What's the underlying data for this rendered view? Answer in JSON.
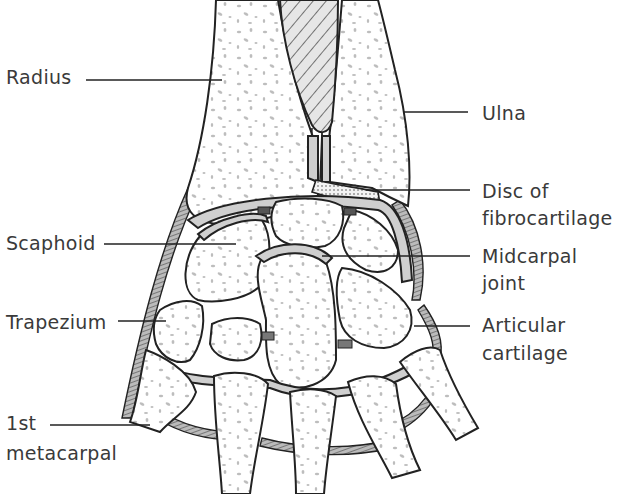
{
  "figure": {
    "labels": {
      "radius": "Radius",
      "ulna": "Ulna",
      "disc_line1": "Disc of",
      "disc_line2": "fibrocartilage",
      "scaphoid": "Scaphoid",
      "midcarpal_line1": "Midcarpal",
      "midcarpal_line2": "joint",
      "trapezium": "Trapezium",
      "articular_line1": "Articular",
      "articular_line2": "cartilage",
      "metacarpal_line1": "1st",
      "metacarpal_line2": "metacarpal"
    },
    "colors": {
      "outline": "#222222",
      "cartilage": "#cfcfcf",
      "bone_speckle": "#bdbdbd",
      "label_text": "#3a3a3a",
      "background": "#ffffff"
    }
  }
}
